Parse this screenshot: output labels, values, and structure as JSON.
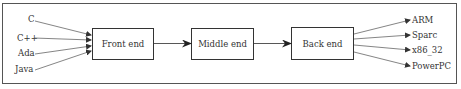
{
  "diagram": {
    "stages": [
      {
        "id": "front",
        "label": "Front end"
      },
      {
        "id": "middle",
        "label": "Middle end"
      },
      {
        "id": "back",
        "label": "Back end"
      }
    ],
    "inputs": [
      "C",
      "C++",
      "Ada",
      "Java"
    ],
    "outputs": [
      "ARM",
      "Sparc",
      "x86_32",
      "PowerPC"
    ],
    "colors": {
      "line": "#555555",
      "text": "#333333",
      "background": "#ffffff"
    }
  }
}
